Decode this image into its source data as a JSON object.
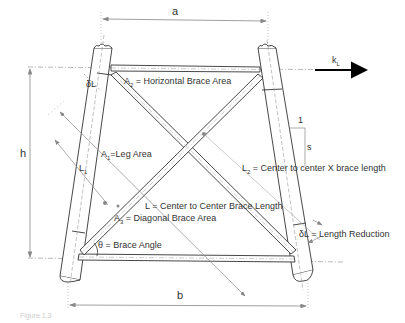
{
  "diagram": {
    "type": "braced tower panel (X-brace) schematic",
    "dimensions": {
      "top_width": "a",
      "bottom_width": "b",
      "height": "h",
      "slope_rise": "1",
      "slope_run": "s",
      "stiffness": "k",
      "stiffness_sub": "L"
    },
    "labels": {
      "a2": {
        "sym": "A",
        "sub": "2",
        "text": " = Horizontal Brace Area"
      },
      "a1": {
        "sym": "A",
        "sub": "1",
        "text": "=Leg Area"
      },
      "a3": {
        "sym": "A",
        "sub": "3",
        "text": " = Diagonal Brace Area"
      },
      "l": {
        "text": "L = Center to Center Brace Length"
      },
      "l1": {
        "sym": "L",
        "sub": "1"
      },
      "l2": {
        "sym": "L",
        "sub": "2",
        "text": " =  Center to center X brace length"
      },
      "theta": {
        "text": "θ = Brace Angle"
      },
      "dl_top": {
        "text": "δL"
      },
      "dl_bottom": {
        "text": "δL = Length Reduction"
      }
    },
    "caption": "Figure 1.3"
  },
  "colors": {
    "line": "#333333",
    "dim": "#888888",
    "arrow": "#000000"
  }
}
